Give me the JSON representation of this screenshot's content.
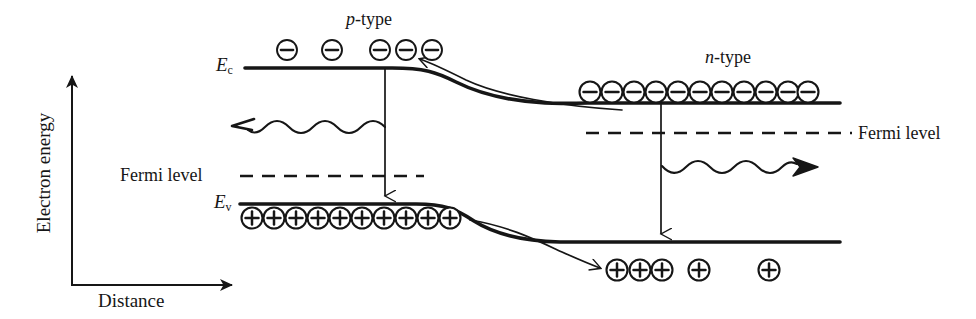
{
  "figure": {
    "title_alt": "Semiconductor p-n junction band diagram under bias",
    "background_color": "#ffffff",
    "ink_color": "#161616",
    "width": 976,
    "height": 319
  },
  "axes": {
    "y_label": "Electron energy",
    "x_label": "Distance"
  },
  "regions": {
    "p_type_label": "p-type",
    "p_type_label_italic_prefix": "p",
    "n_type_label": "n-type",
    "n_type_label_italic_prefix": "n"
  },
  "bands": {
    "conduction_symbol": "E",
    "conduction_subscript": "c",
    "valence_symbol": "E",
    "valence_subscript": "v"
  },
  "fermi": {
    "left_label": "Fermi level",
    "right_label": "Fermi level"
  },
  "carriers": {
    "electron_glyph": "minus-in-circle",
    "hole_glyph": "plus-in-circle",
    "p_conduction_electron_count": 5,
    "n_conduction_electron_count": 11,
    "p_valence_hole_count": 10,
    "n_valence_hole_count": 5
  },
  "chart_data": {
    "type": "line",
    "xlabel": "Distance",
    "ylabel": "Electron energy",
    "grid": false,
    "legend": "none",
    "annotations": [
      "p-type",
      "n-type",
      "Fermi level",
      "Fermi level",
      "Ec",
      "Ev"
    ],
    "series": [
      {
        "name": "Conduction band edge Ec",
        "style": "solid-thick",
        "points": [
          [
            245,
            68
          ],
          [
            385,
            68
          ],
          [
            430,
            69
          ],
          [
            470,
            76
          ],
          [
            510,
            89
          ],
          [
            550,
            99
          ],
          [
            588,
            103
          ],
          [
            640,
            103
          ],
          [
            840,
            103
          ]
        ]
      },
      {
        "name": "Valence band edge Ev",
        "style": "solid-thick",
        "points": [
          [
            240,
            204
          ],
          [
            410,
            204
          ],
          [
            450,
            206
          ],
          [
            490,
            216
          ],
          [
            530,
            234
          ],
          [
            570,
            241
          ],
          [
            620,
            242
          ],
          [
            840,
            242
          ]
        ]
      },
      {
        "name": "Fermi level (p-side, dashed)",
        "style": "dashed",
        "points": [
          [
            240,
            176
          ],
          [
            420,
            176
          ]
        ]
      },
      {
        "name": "Fermi level (n-side, dashed)",
        "style": "dashed",
        "points": [
          [
            588,
            133
          ],
          [
            852,
            133
          ]
        ]
      },
      {
        "name": "Electron drift arrow (conduction band, right to left)",
        "style": "curved-arrow",
        "points": [
          [
            612,
            108
          ],
          [
            500,
            100
          ],
          [
            430,
            78
          ],
          [
            412,
            62
          ]
        ]
      },
      {
        "name": "Hole drift arrow (valence band, left to right)",
        "style": "curved-arrow",
        "points": [
          [
            475,
            222
          ],
          [
            545,
            240
          ],
          [
            600,
            262
          ],
          [
            608,
            268
          ]
        ]
      },
      {
        "name": "Recombination transition (p-side, vertical)",
        "style": "arrow-down",
        "points": [
          [
            385,
            68
          ],
          [
            385,
            204
          ]
        ]
      },
      {
        "name": "Recombination transition (n-side, vertical)",
        "style": "arrow-down",
        "points": [
          [
            661,
            103
          ],
          [
            661,
            242
          ]
        ]
      },
      {
        "name": "Photon emission (p-side, wavy, leftward)",
        "style": "wavy-arrow",
        "points": [
          [
            385,
            127
          ],
          [
            235,
            127
          ]
        ]
      },
      {
        "name": "Photon emission (n-side, wavy, rightward)",
        "style": "wavy-arrow",
        "points": [
          [
            662,
            172
          ],
          [
            815,
            172
          ]
        ]
      }
    ],
    "markers": {
      "electrons_p_conduction": [
        [
          287,
          50
        ],
        [
          332,
          50
        ],
        [
          380,
          50
        ],
        [
          406,
          50
        ],
        [
          432,
          50
        ]
      ],
      "electrons_n_conduction": [
        [
          590,
          92
        ],
        [
          612,
          92
        ],
        [
          634,
          92
        ],
        [
          656,
          92
        ],
        [
          678,
          92
        ],
        [
          700,
          92
        ],
        [
          722,
          92
        ],
        [
          744,
          92
        ],
        [
          766,
          92
        ],
        [
          788,
          92
        ],
        [
          808,
          92
        ]
      ],
      "holes_p_valence": [
        [
          252,
          218
        ],
        [
          274,
          218
        ],
        [
          296,
          218
        ],
        [
          318,
          218
        ],
        [
          340,
          218
        ],
        [
          362,
          218
        ],
        [
          384,
          218
        ],
        [
          406,
          218
        ],
        [
          428,
          218
        ],
        [
          450,
          218
        ]
      ],
      "holes_n_valence": [
        [
          617,
          270
        ],
        [
          640,
          270
        ],
        [
          662,
          270
        ],
        [
          699,
          270
        ],
        [
          769,
          270
        ]
      ]
    },
    "axis_lines": {
      "y_axis": [
        [
          72,
          285
        ],
        [
          72,
          70
        ]
      ],
      "x_axis": [
        [
          72,
          285
        ],
        [
          240,
          285
        ]
      ]
    }
  }
}
